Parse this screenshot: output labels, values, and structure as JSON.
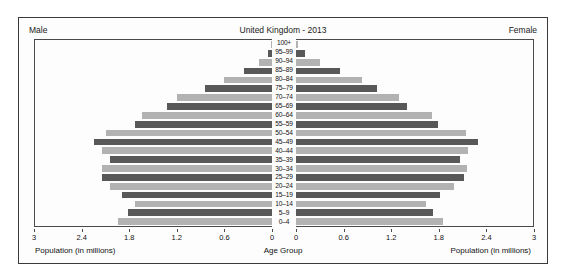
{
  "chart_data": {
    "type": "bar",
    "title": "United Kingdom - 2013",
    "orientation": "population-pyramid",
    "categories": [
      "100+",
      "95–99",
      "90–94",
      "85–89",
      "80–84",
      "75–79",
      "70–74",
      "65–69",
      "60–64",
      "55–59",
      "50–54",
      "45–49",
      "40–44",
      "35–39",
      "30–34",
      "25–29",
      "20–24",
      "15–19",
      "10–14",
      "5–9",
      "0–4"
    ],
    "series": [
      {
        "name": "Male",
        "side": "left",
        "values": [
          0.01,
          0.05,
          0.16,
          0.36,
          0.61,
          0.85,
          1.2,
          1.33,
          1.64,
          1.73,
          2.1,
          2.25,
          2.15,
          2.05,
          2.15,
          2.15,
          2.05,
          1.9,
          1.73,
          1.82,
          1.95
        ]
      },
      {
        "name": "Female",
        "side": "right",
        "values": [
          0.03,
          0.12,
          0.3,
          0.56,
          0.84,
          1.02,
          1.31,
          1.4,
          1.72,
          1.8,
          2.15,
          2.3,
          2.18,
          2.08,
          2.17,
          2.13,
          2.0,
          1.82,
          1.65,
          1.74,
          1.86
        ]
      }
    ],
    "xlabel_left": "Population (in millions)",
    "xlabel_right": "Population (in millions)",
    "xlabel_center": "Age Group",
    "ylabel": "Age Group",
    "xlim_left": [
      3,
      0
    ],
    "xlim_right": [
      0,
      3
    ],
    "ticks_left": [
      "3",
      "2.4",
      "1.8",
      "1.2",
      "0.6",
      "0"
    ],
    "ticks_right": [
      "0",
      "0.6",
      "1.2",
      "1.8",
      "2.4",
      "3"
    ],
    "tick_values": [
      0,
      0.6,
      1.2,
      1.8,
      2.4,
      3
    ],
    "axis_max": 3,
    "grid": false,
    "legend": "none",
    "colors": {
      "bar_dark": "#585858",
      "bar_light": "#b2b2b2",
      "frame": "#3a3a3a",
      "plot_border": "#4a4a4a",
      "background": "#fdfdfd",
      "text": "#111111"
    }
  },
  "header": {
    "left_label": "Male",
    "right_label": "Female",
    "title": "United Kingdom - 2013"
  }
}
